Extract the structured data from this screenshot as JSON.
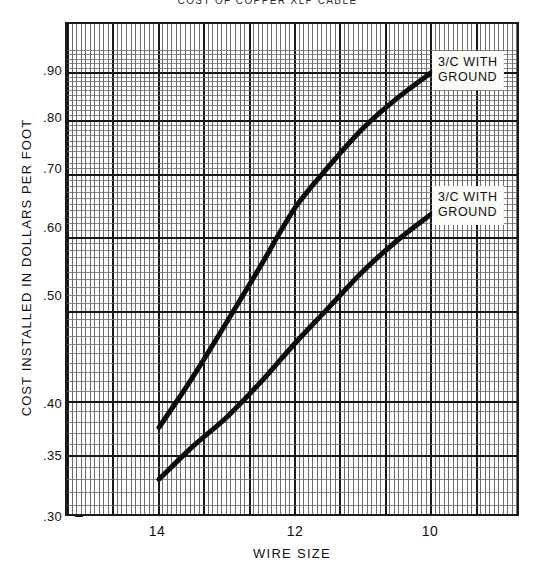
{
  "chart_data": {
    "type": "line",
    "title": "COST OF COPPER XLP CABLE",
    "xlabel": "WIRE SIZE",
    "ylabel": "COST INSTALLED IN DOLLARS PER FOOT",
    "x_scale": "log-reversed (AWG wire size)",
    "y_scale": "log",
    "xticks": [
      "14",
      "12",
      "10"
    ],
    "yticks": [
      ".30",
      ".35",
      ".40",
      ".50",
      ".60",
      ".70",
      ".80",
      ".90"
    ],
    "ylim": [
      0.3,
      0.95
    ],
    "grid": "fine log graph paper, minor and major rulings",
    "legend_position": "inline callout boxes at right end of each curve",
    "series": [
      {
        "name": "3/C WITH GROUND",
        "label": "3/C WITH GROUND",
        "note": "upper curve",
        "points": [
          {
            "wire_size": "14",
            "cost": 0.375
          },
          {
            "wire_size": "13.5",
            "cost": 0.425
          },
          {
            "wire_size": "13",
            "cost": 0.487
          },
          {
            "wire_size": "12.5",
            "cost": 0.56
          },
          {
            "wire_size": "12",
            "cost": 0.645
          },
          {
            "wire_size": "11.5",
            "cost": 0.715
          },
          {
            "wire_size": "11",
            "cost": 0.785
          },
          {
            "wire_size": "10.5",
            "cost": 0.845
          },
          {
            "wire_size": "10",
            "cost": 0.9
          }
        ]
      },
      {
        "name": "3/C WITH GROUND",
        "label": "3/C WITH GROUND",
        "note": "lower curve",
        "points": [
          {
            "wire_size": "14",
            "cost": 0.33
          },
          {
            "wire_size": "13.5",
            "cost": 0.358
          },
          {
            "wire_size": "13",
            "cost": 0.385
          },
          {
            "wire_size": "12.5",
            "cost": 0.42
          },
          {
            "wire_size": "12",
            "cost": 0.462
          },
          {
            "wire_size": "11.5",
            "cost": 0.505
          },
          {
            "wire_size": "11",
            "cost": 0.552
          },
          {
            "wire_size": "10.5",
            "cost": 0.595
          },
          {
            "wire_size": "10",
            "cost": 0.635
          }
        ]
      }
    ]
  },
  "axes": {
    "y_title": "COST INSTALLED IN DOLLARS PER FOOT",
    "x_title": "WIRE SIZE",
    "y_ticks": [
      {
        "label": ".90",
        "y": 70
      },
      {
        "label": ".80",
        "y": 117
      },
      {
        "label": ".70",
        "y": 168
      },
      {
        "label": ".60",
        "y": 227
      },
      {
        "label": ".50",
        "y": 295
      },
      {
        "label": ".40",
        "y": 403
      },
      {
        "label": ".35",
        "y": 455
      },
      {
        "label": ".30",
        "y": 516
      }
    ],
    "x_ticks": [
      {
        "label": "14",
        "x": 157
      },
      {
        "label": "12",
        "x": 295
      },
      {
        "label": "10",
        "x": 430
      }
    ]
  },
  "legend": {
    "callouts": [
      {
        "line1": "3/C WITH",
        "line2": "GROUND",
        "left": 433,
        "top": 52
      },
      {
        "line1": "3/C WITH",
        "line2": "GROUND",
        "left": 433,
        "top": 187
      }
    ]
  },
  "title": {
    "text": "COST OF COPPER XLP CABLE"
  }
}
